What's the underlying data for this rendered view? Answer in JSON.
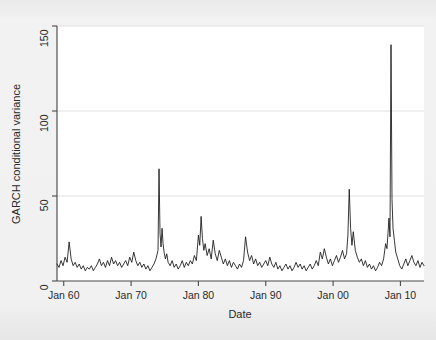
{
  "figure": {
    "background_color": "#f1f1f1",
    "plot_background_color": "#ffffff",
    "axis_color": "#4a4a4a",
    "grid_color": "#dcdcdc",
    "line_color": "#141414"
  },
  "axis": {
    "y_title": "GARCH conditional variance",
    "x_title": "Date",
    "y_ticks": [
      "0",
      "50",
      "100",
      "150"
    ],
    "x_ticks": [
      "Jan 60",
      "Jan 70",
      "Jan 80",
      "Jan 90",
      "Jan 00",
      "Jan 10"
    ]
  },
  "chart_data": {
    "type": "line",
    "title": "",
    "subtitle": "",
    "xlabel": "Date",
    "ylabel": "GARCH conditional variance",
    "xlim": [
      1959.0,
      2013.5
    ],
    "ylim": [
      0,
      150
    ],
    "grid": true,
    "legend": null,
    "x_tick_labels": [
      "Jan 60",
      "Jan 70",
      "Jan 80",
      "Jan 90",
      "Jan 00",
      "Jan 10"
    ],
    "x_tick_values": [
      1960,
      1970,
      1980,
      1990,
      2000,
      2010
    ],
    "y_tick_values": [
      0,
      50,
      100,
      150
    ],
    "series": [
      {
        "name": "GARCH conditional variance",
        "color": "#141414",
        "x": [
          1959.0,
          1959.3,
          1959.6,
          1959.9,
          1960.2,
          1960.5,
          1960.8,
          1961.1,
          1961.4,
          1961.7,
          1962.0,
          1962.3,
          1962.6,
          1962.9,
          1963.2,
          1963.5,
          1963.8,
          1964.1,
          1964.4,
          1964.7,
          1965.0,
          1965.3,
          1965.6,
          1965.9,
          1966.2,
          1966.5,
          1966.8,
          1967.1,
          1967.4,
          1967.7,
          1968.0,
          1968.3,
          1968.6,
          1968.9,
          1969.2,
          1969.5,
          1969.8,
          1970.1,
          1970.4,
          1970.7,
          1971.0,
          1971.3,
          1971.6,
          1971.9,
          1972.2,
          1972.5,
          1972.8,
          1973.1,
          1973.4,
          1973.7,
          1974.0,
          1974.15,
          1974.3,
          1974.45,
          1974.6,
          1974.75,
          1974.9,
          1975.1,
          1975.3,
          1975.5,
          1975.8,
          1976.1,
          1976.4,
          1976.7,
          1977.0,
          1977.3,
          1977.6,
          1977.9,
          1978.2,
          1978.5,
          1978.8,
          1979.1,
          1979.4,
          1979.7,
          1980.0,
          1980.2,
          1980.4,
          1980.6,
          1980.8,
          1981.0,
          1981.3,
          1981.6,
          1981.9,
          1982.2,
          1982.5,
          1982.8,
          1983.1,
          1983.4,
          1983.7,
          1984.0,
          1984.3,
          1984.6,
          1984.9,
          1985.2,
          1985.5,
          1985.8,
          1986.1,
          1986.4,
          1986.7,
          1987.0,
          1987.3,
          1987.6,
          1987.9,
          1988.2,
          1988.5,
          1988.8,
          1989.1,
          1989.4,
          1989.7,
          1990.0,
          1990.3,
          1990.6,
          1990.9,
          1991.2,
          1991.5,
          1991.8,
          1992.1,
          1992.4,
          1992.7,
          1993.0,
          1993.3,
          1993.6,
          1993.9,
          1994.2,
          1994.5,
          1994.8,
          1995.1,
          1995.4,
          1995.7,
          1996.0,
          1996.3,
          1996.6,
          1996.9,
          1997.2,
          1997.5,
          1997.8,
          1998.1,
          1998.4,
          1998.7,
          1999.0,
          1999.3,
          1999.6,
          1999.9,
          2000.2,
          2000.5,
          2000.8,
          2001.1,
          2001.4,
          2001.7,
          2002.0,
          2002.2,
          2002.4,
          2002.6,
          2002.8,
          2003.0,
          2003.3,
          2003.6,
          2003.9,
          2004.2,
          2004.5,
          2004.8,
          2005.1,
          2005.4,
          2005.7,
          2006.0,
          2006.3,
          2006.6,
          2006.9,
          2007.2,
          2007.5,
          2007.8,
          2008.0,
          2008.15,
          2008.3,
          2008.45,
          2008.6,
          2008.75,
          2008.9,
          2009.1,
          2009.3,
          2009.6,
          2009.9,
          2010.2,
          2010.5,
          2010.8,
          2011.1,
          2011.4,
          2011.7,
          2012.0,
          2012.3,
          2012.6,
          2012.9,
          2013.2,
          2013.5
        ],
        "y": [
          10,
          8,
          12,
          9,
          14,
          11,
          23,
          13,
          9,
          11,
          8,
          10,
          7,
          9,
          6,
          8,
          7,
          9,
          6,
          8,
          10,
          13,
          9,
          11,
          8,
          12,
          9,
          14,
          10,
          12,
          9,
          11,
          8,
          10,
          12,
          9,
          14,
          11,
          17,
          12,
          9,
          11,
          8,
          10,
          7,
          9,
          6,
          8,
          10,
          13,
          18,
          66,
          28,
          20,
          31,
          22,
          17,
          13,
          16,
          11,
          9,
          12,
          8,
          10,
          7,
          9,
          12,
          8,
          11,
          9,
          12,
          10,
          15,
          12,
          27,
          21,
          38,
          25,
          18,
          22,
          15,
          19,
          13,
          24,
          16,
          12,
          18,
          14,
          10,
          13,
          9,
          12,
          8,
          11,
          9,
          7,
          10,
          8,
          12,
          26,
          17,
          12,
          15,
          10,
          13,
          9,
          11,
          8,
          10,
          12,
          9,
          14,
          10,
          8,
          11,
          7,
          9,
          6,
          8,
          10,
          7,
          9,
          6,
          8,
          11,
          8,
          10,
          7,
          9,
          6,
          8,
          10,
          7,
          9,
          12,
          9,
          17,
          13,
          19,
          14,
          10,
          13,
          9,
          12,
          15,
          11,
          14,
          18,
          13,
          16,
          27,
          54,
          31,
          21,
          29,
          18,
          14,
          11,
          13,
          9,
          12,
          8,
          10,
          7,
          9,
          6,
          8,
          11,
          9,
          13,
          22,
          19,
          28,
          37,
          26,
          139,
          48,
          31,
          24,
          17,
          13,
          9,
          7,
          10,
          13,
          9,
          12,
          15,
          11,
          9,
          12,
          8,
          11,
          9
        ]
      }
    ]
  }
}
